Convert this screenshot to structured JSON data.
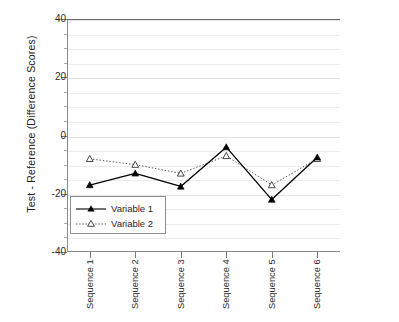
{
  "chart_data": {
    "type": "line",
    "title": "",
    "xlabel": "",
    "ylabel": "Test - Reference (Difference Scores)",
    "categories": [
      "Sequence 1",
      "Sequence 2",
      "Sequence 3",
      "Sequence 4",
      "Sequence 5",
      "Sequence 6"
    ],
    "ylim": [
      -40,
      40
    ],
    "ytick_labels": [
      "40",
      "20",
      "0",
      "-20",
      "-40"
    ],
    "ytick_values": [
      40,
      20,
      0,
      -20,
      -40
    ],
    "yminor_step": 5,
    "grid": true,
    "legend_position": "lower-left-inside",
    "series": [
      {
        "name": "Variable 1",
        "values": [
          -17.0,
          -13.0,
          -17.5,
          -4.0,
          -22.0,
          -7.5
        ],
        "line_style": "solid",
        "marker": "filled-triangle",
        "color": "#000000"
      },
      {
        "name": "Variable 2",
        "values": [
          -8.0,
          -10.0,
          -13.0,
          -7.0,
          -17.0,
          -8.0
        ],
        "line_style": "dotted",
        "marker": "open-triangle",
        "color": "#555555"
      }
    ]
  },
  "legend": {
    "entries": [
      {
        "label": "Variable 1"
      },
      {
        "label": "Variable 2"
      }
    ]
  },
  "colors": {
    "series1": "#000000",
    "series2": "#555555",
    "axis": "#7a7a7a",
    "grid": "#ececec",
    "background": "#ffffff"
  }
}
